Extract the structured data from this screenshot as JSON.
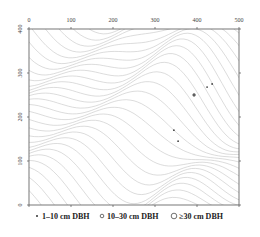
{
  "chart_data": {
    "type": "scatter",
    "title": "",
    "xlabel": "",
    "ylabel": "",
    "xlim": [
      0,
      500
    ],
    "ylim": [
      0,
      400
    ],
    "x_ticks": [
      0,
      100,
      200,
      300,
      400,
      500
    ],
    "y_ticks": [
      0,
      100,
      200,
      300,
      400
    ],
    "x_tick_labels": [
      "0",
      "100",
      "200",
      "300",
      "400",
      "500"
    ],
    "y_tick_labels": [
      "0",
      "100",
      "200",
      "300",
      "400"
    ],
    "x_axis_position": "top",
    "grid": false,
    "background": "topographic contour lines",
    "contour_color": "#b8b8b8",
    "legend_position": "bottom",
    "series": [
      {
        "name": "1–10 cm DBH",
        "marker": "dot",
        "points": [
          [
            424,
            268
          ],
          [
            436,
            275
          ],
          [
            345,
            170
          ],
          [
            355,
            145
          ]
        ]
      },
      {
        "name": "10–30 cm DBH",
        "marker": "small-circle",
        "points": [
          [
            393,
            250
          ]
        ]
      },
      {
        "name": "≥30 cm DBH",
        "marker": "large-circle",
        "points": []
      }
    ],
    "legend": [
      {
        "symbol": "•",
        "label": "1–10 cm DBH"
      },
      {
        "symbol": "○",
        "label": "10–30 cm DBH"
      },
      {
        "symbol": "◯",
        "label": "≥30 cm DBH"
      }
    ]
  }
}
